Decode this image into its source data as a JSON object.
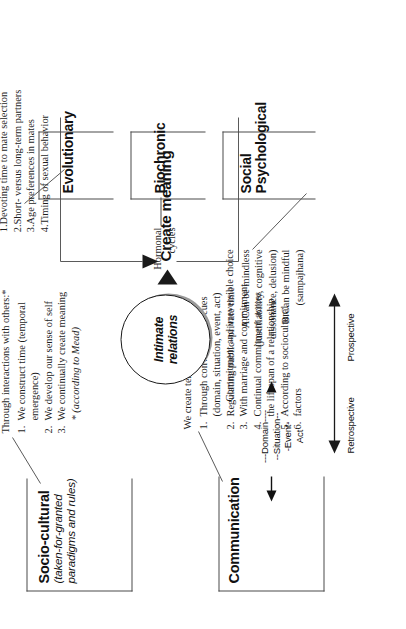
{
  "figure": {
    "center_node": {
      "line1": "Intimate",
      "line2": "relations"
    },
    "outcome_node": "Create meaning"
  },
  "socio_cultural": {
    "title": "Socio-cultural",
    "subtitle_line1": "(taken-for-granted",
    "subtitle_line2": "paradigms and rules)",
    "callout": {
      "header": "Through interactions with others:*",
      "items": [
        {
          "num": "1.",
          "lines": [
            "We construct time (temporal",
            "emergence)"
          ]
        },
        {
          "num": "2.",
          "lines": [
            "We develop our sense of self"
          ]
        },
        {
          "num": "3.",
          "lines": [
            "We continually create meaning"
          ]
        }
      ],
      "footnote": "* (according to Mead)"
    }
  },
  "communication": {
    "title": "Communication",
    "ladder": [
      "---Domain----",
      "--Situation--",
      "-Event-",
      "Act"
    ],
    "axis": {
      "left": "Retrospective",
      "right": "Prospective"
    },
    "callout": {
      "header": "We create temporal context:",
      "items": [
        {
          "num": "1.",
          "lines": [
            "Through conversational cues",
            "(domain, situation, event, act)"
          ]
        },
        {
          "num": "2.",
          "lines": [
            "Regulating public–private time"
          ]
        },
        {
          "num": "3.",
          "lines": [
            "With marriage and commitment"
          ]
        },
        {
          "num": "4.",
          "lines": [
            "Continual commitment across",
            "the lifespan of a relationship"
          ]
        },
        {
          "num": "5.",
          "lines": [
            "According to sociocultural"
          ]
        },
        {
          "num": "6.",
          "lines": [
            "factors"
          ]
        }
      ]
    }
  },
  "evolutionary": {
    "title": "Evolutionary",
    "callout": {
      "items": [
        {
          "num": "1.",
          "lines": [
            "Devoting time to mate selection"
          ]
        },
        {
          "num": "2.",
          "lines": [
            "Short- versus long-term partners"
          ]
        },
        {
          "num": "3.",
          "lines": [
            "Age preferences in mates"
          ]
        },
        {
          "num": "4.",
          "lines": [
            "Timing of sexual behavior"
          ]
        }
      ]
    }
  },
  "biochronic": {
    "title": "Biochronic",
    "callout": {
      "lines": [
        "Hormonal",
        "cycles"
      ]
    }
  },
  "social_psychological": {
    "title_line1": "Social",
    "title_line2": "Psychological",
    "callout": {
      "header": "Commitment and irreversible choice",
      "items": [
        {
          "num": "A.",
          "lines": [
            "Can be mindless",
            "(justifiability, cognitive",
            "dissonance, delusion)"
          ]
        },
        {
          "num": "B.",
          "lines": [
            "Can be mindful",
            "(sampajhana)"
          ]
        }
      ]
    }
  },
  "colors": {
    "ink": "#1a1a1a",
    "line": "#4a4a4a",
    "leader": "#5a5a5a",
    "shadow": "#9a9a9a",
    "paper": "#ffffff"
  }
}
